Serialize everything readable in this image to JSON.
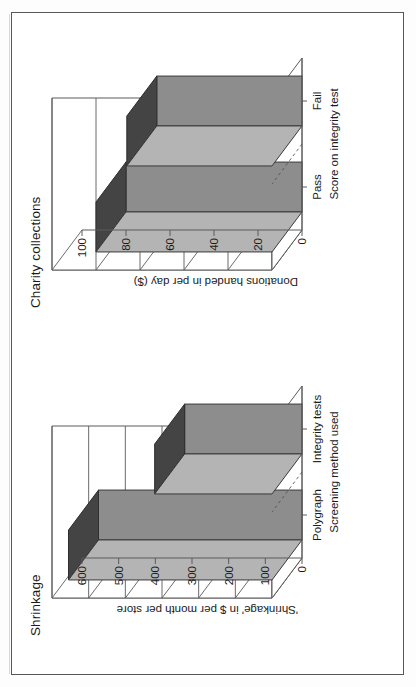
{
  "page": {
    "background_color": "#ffffff",
    "frame_color": "#575757"
  },
  "palette": {
    "bar_front": "#8d8d8d",
    "bar_top": "#444444",
    "bar_side": "#b4b4b4",
    "axis_line": "#5a5a5a",
    "text": "#1b1b1b"
  },
  "charts": [
    {
      "id": "shrinkage",
      "title": "Shrinkage",
      "ylabel": "'Shrinkage' in $ per month per store",
      "xlabel": "Screening method used",
      "categories": [
        "Polygraph",
        "Integrity tests"
      ],
      "values": [
        555,
        320
      ],
      "yticks": [
        "0",
        "100",
        "200",
        "300",
        "400",
        "500",
        "600"
      ],
      "ymin": 0,
      "ymax": 600
    },
    {
      "id": "charity",
      "title": "Charity collections",
      "ylabel": "Donations handed in per day ($)",
      "xlabel": "Score on integrity test",
      "categories": [
        "Pass",
        "Fail"
      ],
      "values": [
        80,
        66
      ],
      "yticks": [
        "0",
        "20",
        "40",
        "60",
        "80",
        "100"
      ],
      "ymin": 0,
      "ymax": 100
    }
  ],
  "chart_data": [
    {
      "type": "bar",
      "title": "Shrinkage",
      "categories": [
        "Polygraph",
        "Integrity tests"
      ],
      "values": [
        555,
        320
      ],
      "xlabel": "Screening method used",
      "ylabel": "'Shrinkage' in $ per month per store",
      "ylim": [
        0,
        600
      ],
      "yticks": [
        0,
        100,
        200,
        300,
        400,
        500,
        600
      ],
      "grid": true,
      "legend": "none",
      "three_d": true,
      "orientation": "vertical-3d"
    },
    {
      "type": "bar",
      "title": "Charity collections",
      "categories": [
        "Pass",
        "Fail"
      ],
      "values": [
        80,
        66
      ],
      "xlabel": "Score on integrity test",
      "ylabel": "Donations handed in per day ($)",
      "ylim": [
        0,
        100
      ],
      "yticks": [
        0,
        20,
        40,
        60,
        80,
        100
      ],
      "grid": true,
      "legend": "none",
      "three_d": true,
      "orientation": "vertical-3d"
    }
  ]
}
